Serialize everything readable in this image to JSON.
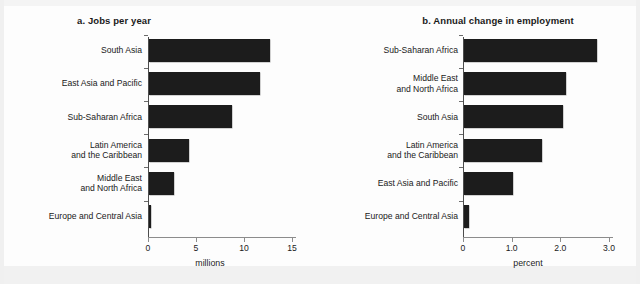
{
  "figure": {
    "axis_caption_units": [
      "millions",
      "percent"
    ]
  },
  "chart_data": [
    {
      "type": "bar",
      "orientation": "horizontal",
      "panel_label": "a.",
      "title": "a.  Jobs per year",
      "title_text": "Jobs per year",
      "xlabel": "millions",
      "ylabel": "",
      "xlim": [
        0,
        15
      ],
      "xticks": [
        0,
        5,
        10,
        15
      ],
      "xticklabels": [
        "0",
        "5",
        "10",
        "15"
      ],
      "grid": false,
      "legend": false,
      "categories": [
        "South Asia",
        "East Asia and Pacific",
        "Sub-Saharan Africa",
        "Latin America\nand the Caribbean",
        "Middle East\nand North Africa",
        "Europe and Central Asia"
      ],
      "values": [
        12.6,
        11.6,
        8.6,
        4.2,
        2.6,
        0.2
      ]
    },
    {
      "type": "bar",
      "orientation": "horizontal",
      "panel_label": "b.",
      "title": "b.  Annual change in employment",
      "title_text": "Annual change in employment",
      "xlabel": "percent",
      "ylabel": "",
      "xlim": [
        0,
        3.0
      ],
      "xticks": [
        0,
        1.0,
        2.0,
        3.0
      ],
      "xticklabels": [
        "0",
        "1.0",
        "2.0",
        "3.0"
      ],
      "grid": false,
      "legend": false,
      "categories": [
        "Sub-Saharan Africa",
        "Middle East\nand North Africa",
        "South Asia",
        "Latin America\nand the Caribbean",
        "East Asia and Pacific",
        "Europe and Central Asia"
      ],
      "values": [
        2.74,
        2.1,
        2.04,
        1.6,
        1.0,
        0.1
      ]
    }
  ],
  "colors": {
    "bar": "#1c1c1c",
    "axis": "#8c8c8c",
    "axis_y": "#4d4d4d",
    "text": "#1a1a1a",
    "background": "#fdfdfd"
  }
}
